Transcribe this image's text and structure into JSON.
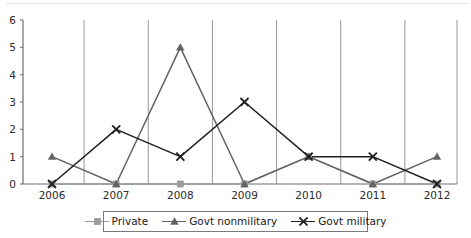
{
  "chart_data": {
    "type": "line",
    "title": "",
    "subtitle": "",
    "xlabel": "",
    "ylabel": "",
    "categories": [
      "2006",
      "2007",
      "2008",
      "2009",
      "2010",
      "2011",
      "2012"
    ],
    "x": [
      2006,
      2007,
      2008,
      2009,
      2010,
      2011,
      2012
    ],
    "ylim": [
      0,
      6
    ],
    "ytick_labels": [
      "0",
      "1",
      "2",
      "3",
      "4",
      "5",
      "6"
    ],
    "ytick_values": [
      0,
      1,
      2,
      3,
      4,
      5,
      6
    ],
    "grid": "vertical-only",
    "legend_position": "bottom-center",
    "series": [
      {
        "name": "Private",
        "marker": "square",
        "color": "#9b9b9b",
        "values": [
          0,
          0,
          0,
          0,
          1,
          0,
          0
        ]
      },
      {
        "name": "Govt nonmilitary",
        "marker": "triangle",
        "color": "#636363",
        "values": [
          1,
          0,
          5,
          0,
          1,
          0,
          1
        ]
      },
      {
        "name": "Govt military",
        "marker": "x",
        "color": "#1f1f1f",
        "values": [
          0,
          2,
          1,
          3,
          1,
          1,
          0
        ]
      }
    ]
  },
  "legend": {
    "items": [
      {
        "label": "Private",
        "color": "#9b9b9b",
        "marker": "square"
      },
      {
        "label": "Govt nonmilitary",
        "color": "#636363",
        "marker": "triangle"
      },
      {
        "label": "Govt military",
        "color": "#1f1f1f",
        "marker": "x"
      }
    ]
  },
  "axes": {
    "axis_color": "#6e6e6e",
    "grid_color": "#8c8c8c",
    "tick_text_color": "#2b2b2b"
  }
}
